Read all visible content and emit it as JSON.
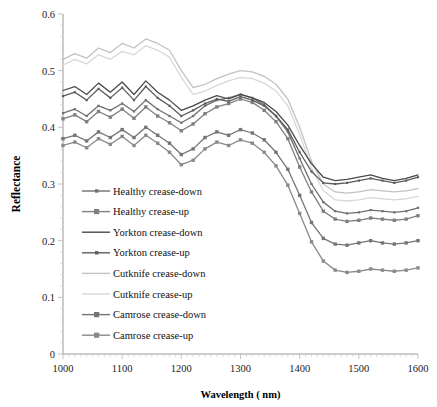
{
  "chart_data": {
    "type": "line",
    "title": "",
    "xlabel": "Wavelength ( nm)",
    "ylabel": "Reflectance",
    "xlim": [
      1000,
      1600
    ],
    "ylim": [
      0,
      0.6
    ],
    "xticks": [
      1000,
      1100,
      1200,
      1300,
      1400,
      1500,
      1600
    ],
    "yticks": [
      "0",
      "0.1",
      "0.2",
      "0.3",
      "0.4",
      "0.5",
      "0.6"
    ],
    "grid": false,
    "legend_position": "inner-lower-left",
    "x": [
      1000,
      1020,
      1040,
      1060,
      1080,
      1100,
      1120,
      1140,
      1160,
      1180,
      1200,
      1220,
      1240,
      1260,
      1280,
      1300,
      1320,
      1340,
      1360,
      1380,
      1400,
      1420,
      1440,
      1460,
      1480,
      1500,
      1520,
      1540,
      1560,
      1580,
      1600
    ],
    "series": [
      {
        "name": "Healthy crease-down",
        "color": "#6f6f6f",
        "marker": "small-dot",
        "values": [
          0.425,
          0.432,
          0.42,
          0.438,
          0.43,
          0.442,
          0.428,
          0.448,
          0.432,
          0.42,
          0.408,
          0.42,
          0.438,
          0.448,
          0.452,
          0.458,
          0.452,
          0.44,
          0.42,
          0.392,
          0.345,
          0.3,
          0.268,
          0.252,
          0.248,
          0.25,
          0.254,
          0.252,
          0.25,
          0.252,
          0.258
        ]
      },
      {
        "name": "Healthy crease-up",
        "color": "#808080",
        "marker": "square",
        "values": [
          0.415,
          0.422,
          0.41,
          0.428,
          0.418,
          0.432,
          0.416,
          0.436,
          0.42,
          0.408,
          0.394,
          0.406,
          0.424,
          0.436,
          0.442,
          0.45,
          0.444,
          0.43,
          0.41,
          0.38,
          0.33,
          0.286,
          0.252,
          0.238,
          0.234,
          0.236,
          0.24,
          0.238,
          0.236,
          0.238,
          0.244
        ]
      },
      {
        "name": "Yorkton crease-down",
        "color": "#4a4a4a",
        "marker": "none",
        "values": [
          0.465,
          0.472,
          0.458,
          0.478,
          0.462,
          0.48,
          0.458,
          0.482,
          0.462,
          0.448,
          0.43,
          0.438,
          0.448,
          0.456,
          0.45,
          0.458,
          0.452,
          0.444,
          0.428,
          0.404,
          0.368,
          0.336,
          0.312,
          0.306,
          0.308,
          0.312,
          0.316,
          0.31,
          0.306,
          0.31,
          0.316
        ]
      },
      {
        "name": "Yorkton crease-up",
        "color": "#5d5d5d",
        "marker": "small-dot",
        "values": [
          0.455,
          0.462,
          0.448,
          0.468,
          0.452,
          0.47,
          0.448,
          0.472,
          0.452,
          0.438,
          0.42,
          0.43,
          0.442,
          0.45,
          0.446,
          0.454,
          0.448,
          0.438,
          0.42,
          0.396,
          0.356,
          0.322,
          0.302,
          0.3,
          0.302,
          0.306,
          0.31,
          0.306,
          0.302,
          0.306,
          0.312
        ]
      },
      {
        "name": "Cutknife crease-down",
        "color": "#c2c2c2",
        "marker": "none",
        "values": [
          0.52,
          0.53,
          0.522,
          0.54,
          0.532,
          0.548,
          0.54,
          0.556,
          0.548,
          0.536,
          0.5,
          0.47,
          0.476,
          0.486,
          0.494,
          0.5,
          0.498,
          0.49,
          0.476,
          0.45,
          0.4,
          0.34,
          0.3,
          0.286,
          0.284,
          0.286,
          0.29,
          0.288,
          0.286,
          0.288,
          0.292
        ]
      },
      {
        "name": "Cutknife crease-up",
        "color": "#d8d8d8",
        "marker": "none",
        "values": [
          0.51,
          0.52,
          0.512,
          0.528,
          0.52,
          0.534,
          0.528,
          0.544,
          0.536,
          0.524,
          0.488,
          0.458,
          0.464,
          0.474,
          0.482,
          0.488,
          0.486,
          0.478,
          0.464,
          0.438,
          0.388,
          0.328,
          0.288,
          0.272,
          0.27,
          0.272,
          0.276,
          0.274,
          0.272,
          0.274,
          0.278
        ]
      },
      {
        "name": "Camrose crease-down",
        "color": "#757575",
        "marker": "square",
        "values": [
          0.38,
          0.386,
          0.376,
          0.392,
          0.382,
          0.396,
          0.382,
          0.4,
          0.386,
          0.372,
          0.352,
          0.362,
          0.382,
          0.392,
          0.386,
          0.396,
          0.39,
          0.378,
          0.356,
          0.326,
          0.28,
          0.232,
          0.204,
          0.194,
          0.192,
          0.196,
          0.2,
          0.196,
          0.194,
          0.196,
          0.2
        ]
      },
      {
        "name": "Camrose crease-up",
        "color": "#8a8a8a",
        "marker": "square",
        "values": [
          0.368,
          0.374,
          0.364,
          0.38,
          0.37,
          0.384,
          0.368,
          0.386,
          0.372,
          0.356,
          0.334,
          0.342,
          0.362,
          0.374,
          0.368,
          0.378,
          0.372,
          0.356,
          0.332,
          0.298,
          0.248,
          0.198,
          0.164,
          0.148,
          0.144,
          0.146,
          0.15,
          0.148,
          0.146,
          0.148,
          0.152
        ]
      }
    ]
  },
  "legend": {
    "items": [
      {
        "label": "Healthy crease-down"
      },
      {
        "label": "Healthy crease-up"
      },
      {
        "label": "Yorkton crease-down"
      },
      {
        "label": "Yorkton crease-up"
      },
      {
        "label": "Cutknife crease-down"
      },
      {
        "label": "Cutknife crease-up"
      },
      {
        "label": "Camrose crease-down"
      },
      {
        "label": "Camrose crease-up"
      }
    ]
  }
}
